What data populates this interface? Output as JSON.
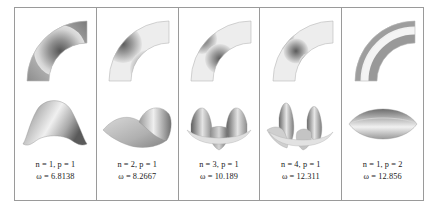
{
  "figure": {
    "type": "mode-shape-table",
    "columns": 5,
    "rows": [
      "contour-plot",
      "3d-surface-plot",
      "mode-label"
    ],
    "geometry": "quarter-annular-sector",
    "colors": {
      "border": "#9a9a9a",
      "background": "#ffffff",
      "contour_low": "#f2f2f2",
      "contour_high": "#4a4a4a",
      "surface_light": "#e8e8e8",
      "surface_dark": "#555555"
    },
    "panels": [
      {
        "id": "mode-1",
        "n": 1,
        "p": 1,
        "omega": 6.8138,
        "label_mode": "n = 1, p = 1",
        "label_omega": "ω = 6.8138",
        "circumferential_lobes": 1,
        "radial_lobes": 1
      },
      {
        "id": "mode-2",
        "n": 2,
        "p": 1,
        "omega": 8.2667,
        "label_mode": "n = 2, p = 1",
        "label_omega": "ω = 8.2667",
        "circumferential_lobes": 2,
        "radial_lobes": 1
      },
      {
        "id": "mode-3",
        "n": 3,
        "p": 1,
        "omega": 10.189,
        "label_mode": "n = 3, p = 1",
        "label_omega": "ω = 10.189",
        "circumferential_lobes": 3,
        "radial_lobes": 1
      },
      {
        "id": "mode-4",
        "n": 4,
        "p": 1,
        "omega": 12.311,
        "label_mode": "n = 4, p = 1",
        "label_omega": "ω = 12.311",
        "circumferential_lobes": 4,
        "radial_lobes": 1
      },
      {
        "id": "mode-5",
        "n": 1,
        "p": 2,
        "omega": 12.856,
        "label_mode": "n = 1, p = 2",
        "label_omega": "ω = 12.856",
        "circumferential_lobes": 1,
        "radial_lobes": 2
      }
    ]
  }
}
